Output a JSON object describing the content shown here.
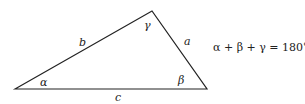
{
  "diagram": {
    "vertices": {
      "A": [
        15,
        89
      ],
      "C": [
        152,
        11
      ],
      "B": [
        207,
        89
      ]
    },
    "sides": {
      "a": "a",
      "b": "b",
      "c": "c"
    },
    "angles": {
      "alpha": "α",
      "beta": "β",
      "gamma": "γ"
    },
    "equation": "α + β + γ = 180°",
    "stroke_color": "#222222"
  }
}
